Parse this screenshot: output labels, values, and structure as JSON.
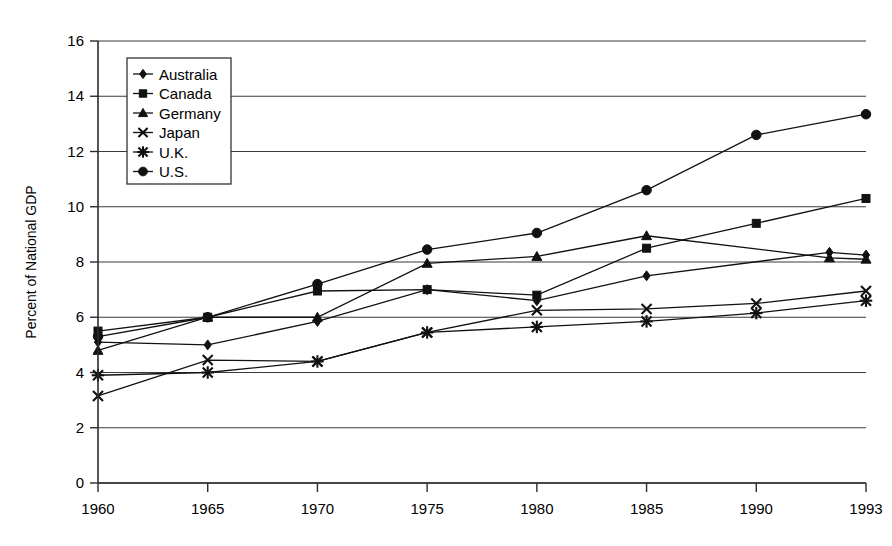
{
  "chart_data": {
    "type": "line",
    "title": "",
    "xlabel": "",
    "ylabel": "Percent of National GDP",
    "categories": [
      "1960",
      "1965",
      "1970",
      "1975",
      "1980",
      "1985",
      "1990",
      "1993"
    ],
    "ylim": [
      0,
      16
    ],
    "yticks": [
      0,
      2,
      4,
      6,
      8,
      10,
      12,
      14,
      16
    ],
    "ytick_labels": [
      "0",
      "2",
      "4",
      "6",
      "8",
      "10",
      "12",
      "14",
      "16"
    ],
    "grid": true,
    "legend_position": "upper-left-inside",
    "series": [
      {
        "name": "Australia",
        "marker": "diamond",
        "x": [
          "1960",
          "1965",
          "1970",
          "1975",
          "1980",
          "1985",
          "1992",
          "1993"
        ],
        "values": [
          5.1,
          5.0,
          5.85,
          7.0,
          6.6,
          7.5,
          8.35,
          8.25
        ]
      },
      {
        "name": "Canada",
        "marker": "square",
        "x": [
          "1960",
          "1965",
          "1970",
          "1975",
          "1980",
          "1985",
          "1990",
          "1993"
        ],
        "values": [
          5.5,
          6.0,
          6.95,
          7.0,
          6.8,
          8.5,
          9.4,
          10.3
        ]
      },
      {
        "name": "Germany",
        "marker": "triangle",
        "x": [
          "1960",
          "1965",
          "1970",
          "1975",
          "1980",
          "1985",
          "1992",
          "1993"
        ],
        "values": [
          4.8,
          6.0,
          6.0,
          7.95,
          8.2,
          8.95,
          8.15,
          8.1
        ]
      },
      {
        "name": "Japan",
        "marker": "cross-x",
        "x": [
          "1960",
          "1965",
          "1970",
          "1975",
          "1980",
          "1985",
          "1990",
          "1993"
        ],
        "values": [
          3.15,
          4.45,
          4.4,
          5.45,
          6.25,
          6.3,
          6.5,
          6.95
        ]
      },
      {
        "name": "U.K.",
        "marker": "asterisk",
        "x": [
          "1960",
          "1965",
          "1970",
          "1975",
          "1980",
          "1985",
          "1990",
          "1993"
        ],
        "values": [
          3.9,
          4.0,
          4.4,
          5.45,
          5.65,
          5.85,
          6.15,
          6.6
        ]
      },
      {
        "name": "U.S.",
        "marker": "circle",
        "x": [
          "1960",
          "1965",
          "1970",
          "1975",
          "1980",
          "1985",
          "1990",
          "1993"
        ],
        "values": [
          5.3,
          6.0,
          7.2,
          8.45,
          9.05,
          10.6,
          12.6,
          13.35
        ]
      }
    ],
    "legend_entries": [
      {
        "label": "Australia",
        "marker": "diamond"
      },
      {
        "label": "Canada",
        "marker": "square"
      },
      {
        "label": "Germany",
        "marker": "triangle"
      },
      {
        "label": "Japan",
        "marker": "cross-x"
      },
      {
        "label": "U.K.",
        "marker": "asterisk"
      },
      {
        "label": "U.S.",
        "marker": "circle"
      }
    ],
    "colors": {
      "line": "#111111",
      "grid": "#3a3a3a",
      "axis": "#2b2b2b",
      "background": "#ffffff"
    }
  }
}
